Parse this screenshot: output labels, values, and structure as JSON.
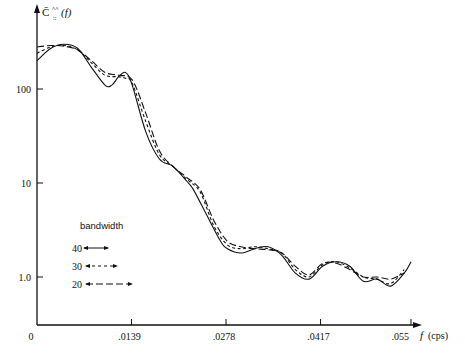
{
  "chart_data": {
    "type": "line",
    "title": "",
    "xlabel": "f (cps)",
    "ylabel": "C̄^^_::(f)",
    "y_scale": "log",
    "xlim": [
      0,
      0.055
    ],
    "ylim": [
      0.3,
      400
    ],
    "x_ticks": [
      "0",
      ".0139",
      ".0278",
      ".0417",
      ".055"
    ],
    "x_tick_values": [
      0,
      0.0139,
      0.0278,
      0.0417,
      0.055
    ],
    "y_ticks": [
      "100",
      "10",
      "1.0"
    ],
    "y_tick_values": [
      100,
      10,
      1.0
    ],
    "grid": false,
    "legend": {
      "title": "bandwidth",
      "position": "lower-left",
      "entries": [
        {
          "label": "40",
          "style": "solid"
        },
        {
          "label": "30",
          "style": "short-dash"
        },
        {
          "label": "20",
          "style": "long-dash"
        }
      ]
    },
    "series": [
      {
        "name": "40",
        "style": "solid",
        "x": [
          0,
          0.002,
          0.004,
          0.006,
          0.008,
          0.01,
          0.011,
          0.012,
          0.013,
          0.014,
          0.016,
          0.018,
          0.02,
          0.022,
          0.023,
          0.025,
          0.027,
          0.028,
          0.03,
          0.032,
          0.034,
          0.036,
          0.038,
          0.04,
          0.042,
          0.044,
          0.046,
          0.048,
          0.05,
          0.052,
          0.054,
          0.055
        ],
        "values": [
          200,
          270,
          300,
          270,
          170,
          110,
          110,
          135,
          150,
          110,
          35,
          18,
          15,
          10.5,
          8.5,
          4.5,
          2.4,
          2.0,
          1.8,
          2.0,
          2.1,
          1.7,
          1.1,
          0.95,
          1.3,
          1.45,
          1.3,
          0.9,
          0.95,
          0.8,
          1.1,
          1.45
        ]
      },
      {
        "name": "30",
        "style": "short-dash",
        "x": [
          0,
          0.002,
          0.004,
          0.006,
          0.008,
          0.01,
          0.012,
          0.013,
          0.014,
          0.016,
          0.018,
          0.02,
          0.022,
          0.024,
          0.026,
          0.028,
          0.03,
          0.032,
          0.034,
          0.036,
          0.038,
          0.04,
          0.042,
          0.044,
          0.046,
          0.048,
          0.05,
          0.052,
          0.054
        ],
        "values": [
          240,
          280,
          290,
          260,
          190,
          140,
          135,
          130,
          115,
          45,
          20,
          15,
          11,
          8,
          3.5,
          2.2,
          2.0,
          2.1,
          2.0,
          1.8,
          1.2,
          1.0,
          1.35,
          1.45,
          1.25,
          1.0,
          0.95,
          0.85,
          1.2
        ]
      },
      {
        "name": "20",
        "style": "long-dash",
        "x": [
          0,
          0.002,
          0.004,
          0.006,
          0.008,
          0.01,
          0.012,
          0.014,
          0.016,
          0.018,
          0.02,
          0.022,
          0.024,
          0.026,
          0.028,
          0.03,
          0.032,
          0.034,
          0.036,
          0.038,
          0.04,
          0.042,
          0.044,
          0.046,
          0.048,
          0.05,
          0.052,
          0.054
        ],
        "values": [
          280,
          290,
          285,
          260,
          200,
          150,
          140,
          125,
          55,
          22,
          15,
          11.5,
          8.5,
          4,
          2.4,
          2.1,
          2.0,
          1.95,
          1.8,
          1.3,
          1.05,
          1.4,
          1.4,
          1.2,
          1.0,
          1.0,
          0.95,
          1.1
        ]
      }
    ]
  },
  "axes": {
    "y_label_main": "C̄",
    "y_label_sup": "^^",
    "y_label_sub": "::",
    "y_label_arg": "(f)",
    "x_label_var": "f",
    "x_label_unit": "(cps)"
  },
  "legend": {
    "title": "bandwidth",
    "entries": [
      "40",
      "30",
      "20"
    ]
  }
}
